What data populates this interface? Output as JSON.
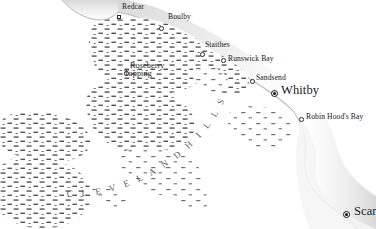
{
  "map": {
    "title": "North York Moors coastal map",
    "region_label": "C L E V E L A N D   H I L L S",
    "region_label_plain": "CLEVELAND HILLS",
    "colors": {
      "land": "#ffffff",
      "sea": "#ffffff",
      "coastline_shadow": "#c9c9c9",
      "moorland_hatch": "#555555",
      "text": "#1a1a1a",
      "region_text": "#5a5a5a",
      "marker_stroke": "#2a2a2a"
    },
    "places": [
      {
        "name": "Redcar",
        "label": "Redcar",
        "x": 122,
        "y": 3,
        "marker_x": 117,
        "marker_y": 15,
        "marker": "square",
        "size": "small"
      },
      {
        "name": "Boulby",
        "label": "Boulby",
        "x": 168,
        "y": 13,
        "marker_x": 159,
        "marker_y": 26,
        "marker": "open-circle",
        "size": "small"
      },
      {
        "name": "Staithes",
        "label": "Staithes",
        "x": 205,
        "y": 41,
        "marker_x": 200,
        "marker_y": 52,
        "marker": "open-circle",
        "size": "small"
      },
      {
        "name": "Runswick Bay",
        "label": "Runswick Bay",
        "x": 228,
        "y": 55,
        "marker_x": 221,
        "marker_y": 58,
        "marker": "open-circle",
        "size": "small"
      },
      {
        "name": "Sandsend",
        "label": "Sandsend",
        "x": 256,
        "y": 75,
        "marker_x": 250,
        "marker_y": 79,
        "marker": "open-circle",
        "size": "small"
      },
      {
        "name": "Whitby",
        "label": "Whitby",
        "x": 282,
        "y": 86,
        "marker_x": 271,
        "marker_y": 90,
        "marker": "city",
        "size": "large"
      },
      {
        "name": "Robin Hood's Bay",
        "label": "Robin Hood's Bay",
        "x": 307,
        "y": 115,
        "marker_x": 299,
        "marker_y": 117,
        "marker": "open-circle",
        "size": "small"
      },
      {
        "name": "Scarborough",
        "label": "Scar",
        "x": 355,
        "y": 208,
        "marker_x": 343,
        "marker_y": 211,
        "marker": "city",
        "size": "large"
      }
    ],
    "hill_places": [
      {
        "name": "Roseberry Topping",
        "line1": "Roseberry",
        "line2": "Topping",
        "x": 130,
        "y": 63,
        "marker_x": 124,
        "marker_y": 71,
        "marker": "open-circle",
        "size": "medium"
      }
    ]
  }
}
